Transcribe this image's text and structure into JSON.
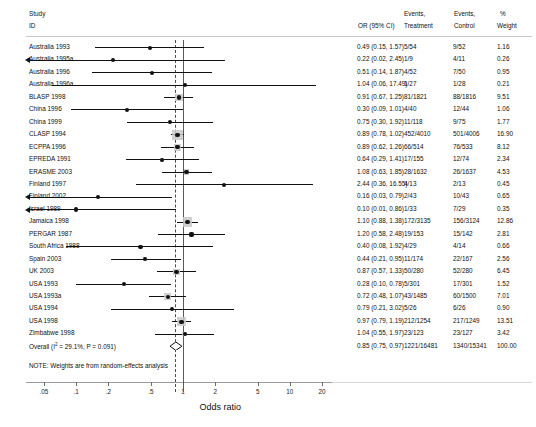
{
  "header": {
    "study": "Study",
    "id": "ID",
    "or_ci": "OR (95% CI)",
    "events_treatment_l1": "Events,",
    "events_treatment_l2": "Treatment",
    "events_control_l1": "Events,",
    "events_control_l2": "Control",
    "weight_l1": "%",
    "weight_l2": "Weight"
  },
  "axis": {
    "title": "Odds ratio",
    "ticks": [
      ".05",
      ".1",
      ".2",
      ".5",
      "1",
      "2",
      "5",
      "10",
      "20"
    ],
    "tick_values": [
      0.05,
      0.1,
      0.2,
      0.5,
      1,
      2,
      5,
      10,
      20
    ],
    "scale": "log",
    "null_value": 1,
    "pooled_line": 0.85
  },
  "note": "NOTE: Weights are from random-effects analysis",
  "overall": {
    "label": "Overall (I² = 29.1%, P = 0.091)",
    "or_ci": "0.85 (0.75, 0.97)",
    "or": 0.85,
    "lcl": 0.75,
    "ucl": 0.97,
    "events_treatment": "1221/16481",
    "events_control": "1340/15341",
    "weight": "100.00"
  },
  "chart_data": {
    "type": "forest",
    "title": "",
    "xlabel": "Odds ratio",
    "ylabel": "",
    "xscale": "log",
    "xlim": [
      0.04,
      25
    ],
    "grid": false,
    "null_line": 1,
    "pooled_line": 0.85,
    "columns": [
      "Study ID",
      "OR (95% CI)",
      "Events, Treatment",
      "Events, Control",
      "% Weight"
    ],
    "studies": [
      {
        "id": "Australia 1993",
        "or": 0.49,
        "lcl": 0.15,
        "ucl": 1.57,
        "or_ci": "0.49 (0.15, 1.57)",
        "events_treatment": "5/54",
        "events_control": "9/52",
        "weight": "1.16",
        "w": 1.16
      },
      {
        "id": "Australia 1995a",
        "or": 0.22,
        "lcl": 0.02,
        "ucl": 2.45,
        "or_ci": "0.22 (0.02, 2.45)",
        "events_treatment": "1/9",
        "events_control": "4/11",
        "weight": "0.26",
        "w": 0.26
      },
      {
        "id": "Australia 1996",
        "or": 0.51,
        "lcl": 0.14,
        "ucl": 1.87,
        "or_ci": "0.51 (0.14, 1.87)",
        "events_treatment": "4/52",
        "events_control": "7/50",
        "weight": "0.95",
        "w": 0.95
      },
      {
        "id": "Australia 1996a",
        "or": 1.04,
        "lcl": 0.06,
        "ucl": 17.49,
        "or_ci": "1.04 (0.06, 17.49)",
        "events_treatment": "1/27",
        "events_control": "1/28",
        "weight": "0.21",
        "w": 0.21
      },
      {
        "id": "BLASP 1998",
        "or": 0.91,
        "lcl": 0.67,
        "ucl": 1.25,
        "or_ci": "0.91 (0.67, 1.25)",
        "events_treatment": "81/1821",
        "events_control": "88/1816",
        "weight": "9.51",
        "w": 9.51
      },
      {
        "id": "China 1996",
        "or": 0.3,
        "lcl": 0.09,
        "ucl": 1.01,
        "or_ci": "0.30 (0.09, 1.01)",
        "events_treatment": "4/40",
        "events_control": "12/44",
        "weight": "1.06",
        "w": 1.06
      },
      {
        "id": "China 1999",
        "or": 0.75,
        "lcl": 0.3,
        "ucl": 1.92,
        "or_ci": "0.75 (0.30, 1.92)",
        "events_treatment": "11/118",
        "events_control": "9/75",
        "weight": "1.77",
        "w": 1.77
      },
      {
        "id": "CLASP 1994",
        "or": 0.89,
        "lcl": 0.78,
        "ucl": 1.02,
        "or_ci": "0.89 (0.78, 1.02)",
        "events_treatment": "452/4010",
        "events_control": "501/4006",
        "weight": "16.90",
        "w": 16.9
      },
      {
        "id": "ECPPA 1996",
        "or": 0.89,
        "lcl": 0.62,
        "ucl": 1.26,
        "or_ci": "0.89 (0.62, 1.26)",
        "events_treatment": "66/514",
        "events_control": "76/533",
        "weight": "8.12",
        "w": 8.12
      },
      {
        "id": "EPREDA 1991",
        "or": 0.64,
        "lcl": 0.29,
        "ucl": 1.41,
        "or_ci": "0.64 (0.29, 1.41)",
        "events_treatment": "17/155",
        "events_control": "12/74",
        "weight": "2.34",
        "w": 2.34
      },
      {
        "id": "ERASME 2003",
        "or": 1.08,
        "lcl": 0.63,
        "ucl": 1.85,
        "or_ci": "1.08 (0.63, 1.85)",
        "events_treatment": "28/1632",
        "events_control": "26/1637",
        "weight": "4.53",
        "w": 4.53
      },
      {
        "id": "Finland 1997",
        "or": 2.44,
        "lcl": 0.36,
        "ucl": 16.55,
        "or_ci": "2.44 (0.36, 16.55)",
        "events_treatment": "4/13",
        "events_control": "2/13",
        "weight": "0.45",
        "w": 0.45
      },
      {
        "id": "Finland 2002",
        "or": 0.16,
        "lcl": 0.03,
        "ucl": 0.79,
        "or_ci": "0.16 (0.03, 0.79)",
        "events_treatment": "2/43",
        "events_control": "10/43",
        "weight": "0.65",
        "w": 0.65
      },
      {
        "id": "Israel 1989",
        "or": 0.1,
        "lcl": 0.01,
        "ucl": 0.86,
        "or_ci": "0.10 (0.01, 0.86)",
        "events_treatment": "1/33",
        "events_control": "7/29",
        "weight": "0.35",
        "w": 0.35
      },
      {
        "id": "Jamaica 1998",
        "or": 1.1,
        "lcl": 0.88,
        "ucl": 1.38,
        "or_ci": "1.10 (0.88, 1.38)",
        "events_treatment": "172/3135",
        "events_control": "156/3124",
        "weight": "12.86",
        "w": 12.86
      },
      {
        "id": "PERGAR 1987",
        "or": 1.2,
        "lcl": 0.58,
        "ucl": 2.48,
        "or_ci": "1.20 (0.58, 2.48)",
        "events_treatment": "19/153",
        "events_control": "15/142",
        "weight": "2.81",
        "w": 2.81
      },
      {
        "id": "South Africa 1988",
        "or": 0.4,
        "lcl": 0.08,
        "ucl": 1.92,
        "or_ci": "0.40 (0.08, 1.92)",
        "events_treatment": "4/29",
        "events_control": "4/14",
        "weight": "0.66",
        "w": 0.66
      },
      {
        "id": "Spain 2003",
        "or": 0.44,
        "lcl": 0.21,
        "ucl": 0.95,
        "or_ci": "0.44 (0.21, 0.95)",
        "events_treatment": "11/174",
        "events_control": "22/167",
        "weight": "2.56",
        "w": 2.56
      },
      {
        "id": "UK 2003",
        "or": 0.87,
        "lcl": 0.57,
        "ucl": 1.33,
        "or_ci": "0.87 (0.57, 1.33)",
        "events_treatment": "50/280",
        "events_control": "52/280",
        "weight": "6.45",
        "w": 6.45
      },
      {
        "id": "USA 1993",
        "or": 0.28,
        "lcl": 0.1,
        "ucl": 0.78,
        "or_ci": "0.28 (0.10, 0.78)",
        "events_treatment": "5/301",
        "events_control": "17/301",
        "weight": "1.52",
        "w": 1.52
      },
      {
        "id": "USA 1993a",
        "or": 0.72,
        "lcl": 0.48,
        "ucl": 1.07,
        "or_ci": "0.72 (0.48, 1.07)",
        "events_treatment": "43/1485",
        "events_control": "60/1500",
        "weight": "7.01",
        "w": 7.01
      },
      {
        "id": "USA 1994",
        "or": 0.79,
        "lcl": 0.21,
        "ucl": 3.02,
        "or_ci": "0.79 (0.21, 3.02)",
        "events_treatment": "5/26",
        "events_control": "6/26",
        "weight": "0.90",
        "w": 0.9
      },
      {
        "id": "USA 1998",
        "or": 0.97,
        "lcl": 0.79,
        "ucl": 1.19,
        "or_ci": "0.97 (0.79, 1.19)",
        "events_treatment": "212/1254",
        "events_control": "217/1249",
        "weight": "13.51",
        "w": 13.51
      },
      {
        "id": "Zimbabwe 1998",
        "or": 1.04,
        "lcl": 0.55,
        "ucl": 1.97,
        "or_ci": "1.04 (0.55, 1.97)",
        "events_treatment": "23/123",
        "events_control": "23/127",
        "weight": "3.42",
        "w": 3.42
      }
    ],
    "overall": {
      "label": "Overall (I² = 29.1%, P = 0.091)",
      "or": 0.85,
      "lcl": 0.75,
      "ucl": 0.97,
      "or_ci": "0.85 (0.75, 0.97)",
      "events_treatment": "1221/16481",
      "events_control": "1340/15341",
      "weight": "100.00"
    },
    "annotations": [
      "NOTE: Weights are from random-effects analysis"
    ]
  }
}
